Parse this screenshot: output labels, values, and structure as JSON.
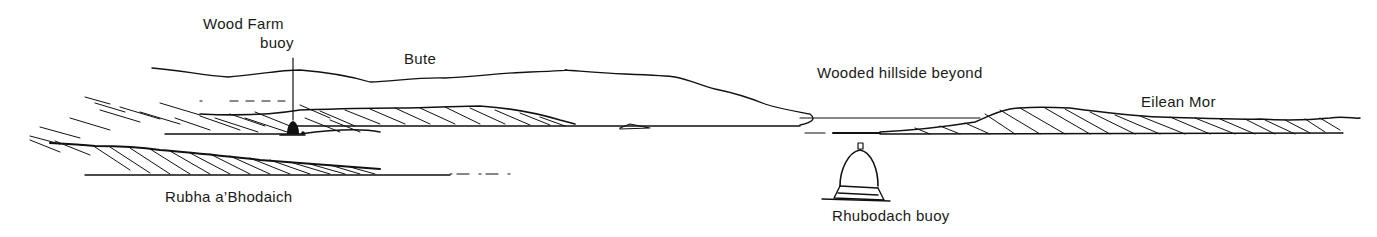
{
  "diagram": {
    "type": "coastal-view-sketch",
    "ink_color": "#111111",
    "background": "#ffffff"
  },
  "labels": {
    "wood_farm": "Wood Farm",
    "wood_farm_buoy": "buoy",
    "bute": "Bute",
    "wooded_hillside": "Wooded hillside beyond",
    "eilean_mor": "Eilean Mor",
    "rubha": "Rubha a’Bhodaich",
    "rhubodach_buoy": "Rhubodach buoy"
  },
  "features": [
    {
      "id": "bute",
      "kind": "hill-skyline"
    },
    {
      "id": "wood-farm-buoy",
      "kind": "buoy-conical-filled"
    },
    {
      "id": "rubha-a-bhodaich",
      "kind": "headland-hatched"
    },
    {
      "id": "eilean-mor",
      "kind": "island-hatched"
    },
    {
      "id": "rhubodach-buoy",
      "kind": "buoy-conical-outline"
    }
  ]
}
